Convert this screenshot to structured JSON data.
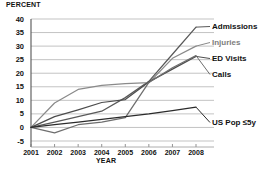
{
  "chart_data": {
    "type": "line",
    "title": "",
    "ylabel": "PERCENT",
    "xlabel": "YEAR",
    "x": [
      2001,
      2002,
      2003,
      2004,
      2005,
      2006,
      2007,
      2008
    ],
    "xticks": [
      "2001",
      "2002",
      "2003",
      "2004",
      "2005",
      "2006",
      "2007",
      "2008"
    ],
    "yticks": [
      "40",
      "35",
      "30",
      "25",
      "20",
      "15",
      "10",
      "5",
      "0",
      "-5"
    ],
    "ylim": [
      -5,
      40
    ],
    "xlim": [
      2001,
      2008
    ],
    "grid": true,
    "legend_position": "right",
    "series": [
      {
        "name": "Admissions",
        "color": "#595959",
        "values": [
          0,
          2,
          4,
          6,
          11,
          17,
          27,
          37
        ]
      },
      {
        "name": "Injuries",
        "color": "#8a8a8a",
        "values": [
          0,
          9,
          14,
          15.5,
          16.2,
          16.5,
          25.5,
          30
        ]
      },
      {
        "name": "ED Visits",
        "color": "#4d4d4d",
        "values": [
          0,
          4,
          6.5,
          9.2,
          10.3,
          16.8,
          21.5,
          26.2
        ]
      },
      {
        "name": "Calls",
        "color": "#6e6e6e",
        "values": [
          0,
          -2,
          1,
          2,
          3.6,
          16.6,
          22,
          26.5
        ]
      },
      {
        "name": "US Pop ≤5y",
        "color": "#2b2b2b",
        "values": [
          0,
          1,
          2,
          3,
          4,
          5,
          6.2,
          7.5
        ]
      }
    ]
  },
  "legend": {
    "items": [
      {
        "label": "Admissions",
        "faint": false
      },
      {
        "label": "Injuries",
        "faint": true
      },
      {
        "label": "ED Visits",
        "faint": false
      },
      {
        "label": "Calls",
        "faint": false
      },
      {
        "label": "US Pop ≤5y",
        "faint": false
      }
    ]
  }
}
